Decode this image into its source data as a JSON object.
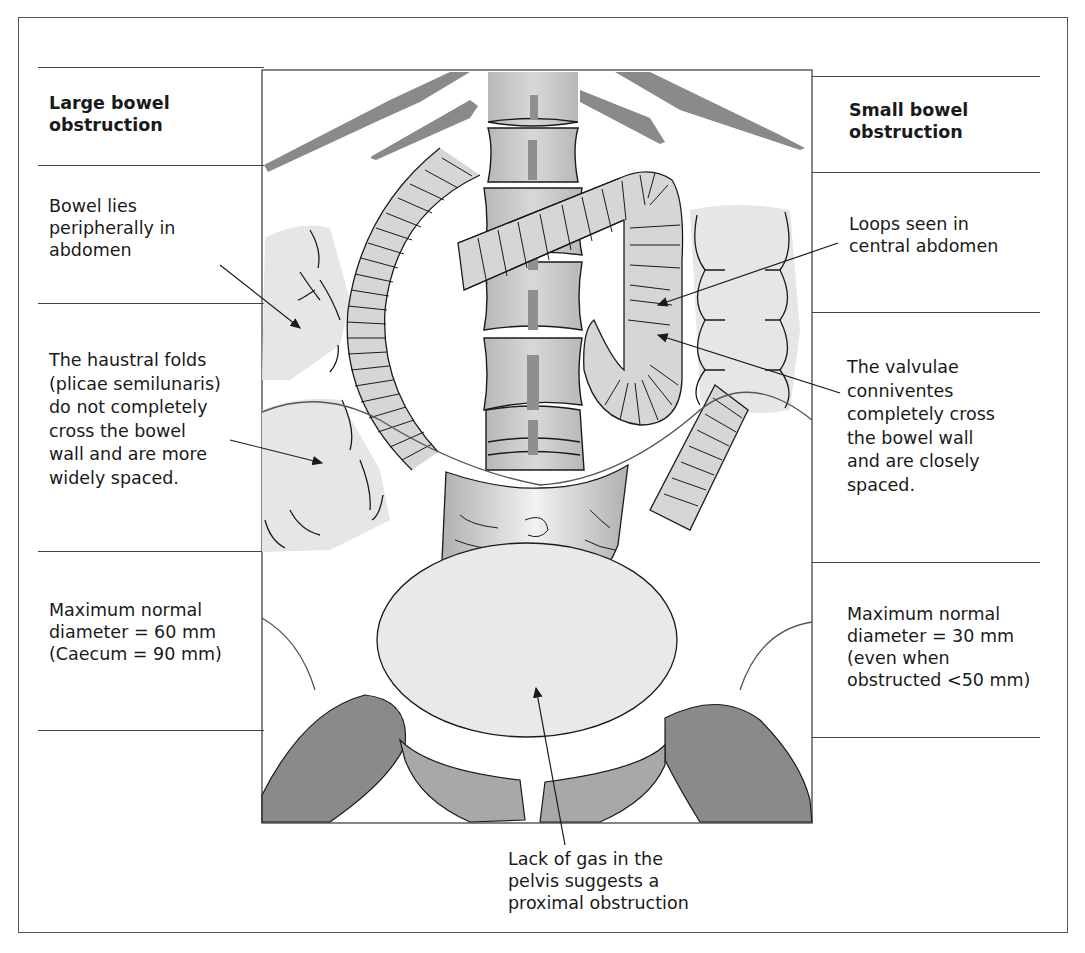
{
  "figure": {
    "left_column": {
      "heading": "Large bowel\nobstruction",
      "notes": [
        "Bowel lies\nperipherally in\nabdomen",
        "The haustral folds\n(plicae semilunaris)\ndo not completely\ncross the bowel\nwall and are more\nwidely spaced.",
        "Maximum normal\ndiameter = 60 mm\n(Caecum = 90 mm)"
      ]
    },
    "right_column": {
      "heading": "Small bowel\nobstruction",
      "notes": [
        "Loops seen in\ncentral abdomen",
        "The valvulae\nconniventes\ncompletely cross\nthe bowel wall\nand are closely\nspaced.",
        "Maximum normal\ndiameter = 30 mm\n(even when\nobstructed <50 mm)"
      ]
    },
    "bottom_note": "Lack of gas in the\npelvis suggests a\nproximal obstruction",
    "colors": {
      "bone": "#8a8a8a",
      "vertebra": "#c4c4c4",
      "bowel_fill": "#d6d6d6",
      "large_bowel_fill": "#e6e6e6",
      "bladder": "#e9e9e9",
      "line": "#1a1a1a",
      "rule": "#444444"
    }
  }
}
